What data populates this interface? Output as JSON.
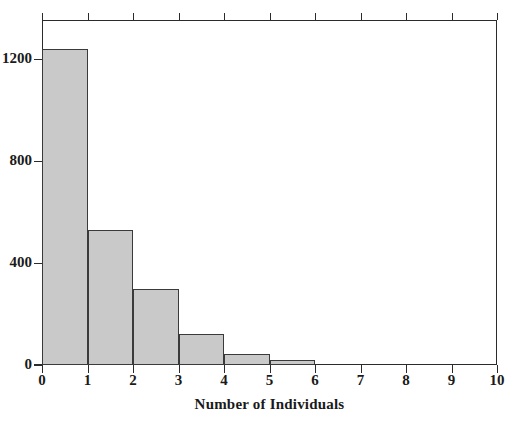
{
  "chart_data": {
    "type": "bar",
    "title": "",
    "subtitle": "",
    "xlabel": "Number of Individuals",
    "ylabel": "",
    "categories": [
      "0-1",
      "1-2",
      "2-3",
      "3-4",
      "4-5",
      "5-6",
      "6-7",
      "7-8",
      "8-9",
      "9-10"
    ],
    "bin_edges": [
      0,
      1,
      2,
      3,
      4,
      5,
      6,
      7,
      8,
      9,
      10
    ],
    "values": [
      1240,
      530,
      300,
      120,
      45,
      18,
      0,
      0,
      0,
      0
    ],
    "xlim": [
      0,
      10
    ],
    "ylim": [
      0,
      1355
    ],
    "xticks": [
      0,
      1,
      2,
      3,
      4,
      5,
      6,
      7,
      8,
      9,
      10
    ],
    "yticks": [
      0,
      400,
      800,
      1200
    ],
    "xtick_labels": [
      "0",
      "1",
      "2",
      "3",
      "4",
      "5",
      "6",
      "7",
      "8",
      "9",
      "10"
    ],
    "ytick_labels": [
      "0",
      "400",
      "800",
      "1200"
    ],
    "grid": false,
    "legend": null,
    "bar_fill_color": "#c9c9c9",
    "bar_edge_color": "#3a3a3a",
    "axis_color": "#2b2b2b",
    "background_color": "#ffffff"
  },
  "figure": {
    "axis_title_bottom": "Number of Individuals"
  }
}
